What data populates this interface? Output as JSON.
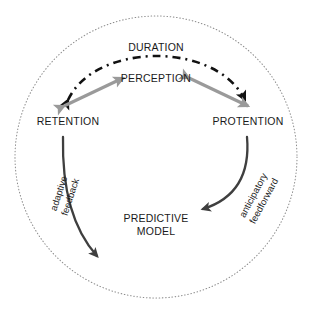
{
  "diagram": {
    "boundary": {
      "name": "outer-circle",
      "style": "dotted",
      "color": "#8c8c8c"
    },
    "nodes": {
      "duration": "DURATION",
      "perception": "PERCEPTION",
      "retention": "RETENTION",
      "protention": "PROTENTION",
      "predictive_model_line1": "PREDICTIVE",
      "predictive_model_line2": "MODEL"
    },
    "edges": {
      "dashed_arc": {
        "name": "duration-arc",
        "style": "dash-dot",
        "color": "#111111",
        "from": "PROTENTION",
        "to": "RETENTION",
        "arrowheads": "both"
      },
      "gray_left": {
        "name": "retention-perception-arrow",
        "style": "solid",
        "color": "#9a9a9a",
        "from": "RETENTION",
        "to": "PERCEPTION",
        "arrowheads": "both"
      },
      "gray_right": {
        "name": "perception-protention-arrow",
        "style": "solid",
        "color": "#9a9a9a",
        "from": "PERCEPTION",
        "to": "PROTENTION",
        "arrowheads": "both"
      },
      "adaptive_feedback": {
        "name": "adaptive-feedback-curve",
        "label_line1": "adaptive",
        "label_line2": "feedback",
        "style": "solid",
        "color": "#4a4a4a",
        "from": "RETENTION",
        "to": "PREDICTIVE MODEL"
      },
      "anticipatory_feedforward": {
        "name": "anticipatory-feedforward-curve",
        "label_line1": "anticipatory",
        "label_line2": "feedforward",
        "style": "solid",
        "color": "#4a4a4a",
        "from": "PROTENTION",
        "to": "PREDICTIVE MODEL"
      }
    },
    "colors": {
      "background": "#ffffff",
      "text": "#1a1a1a",
      "dark_stroke": "#111111",
      "gray_stroke": "#9a9a9a",
      "curve_stroke": "#4a4a4a",
      "boundary_stroke": "#8c8c8c"
    }
  }
}
